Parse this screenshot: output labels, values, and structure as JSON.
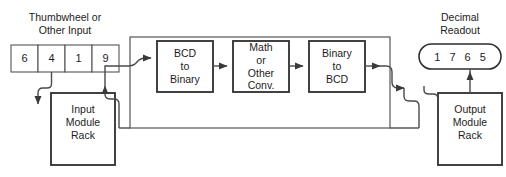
{
  "diagram": {
    "colors": {
      "background": "#ffffff",
      "box_stroke": "#2e2e2e",
      "wire": "#4a4a4a",
      "thin_stroke": "#555555",
      "text": "#1c1c1c"
    }
  },
  "input_section": {
    "caption": "Thumbwheel or\nOther Input",
    "digits": [
      "6",
      "4",
      "1",
      "9"
    ],
    "rack_label": "Input\nModule\nRack"
  },
  "processor": {
    "blocks": [
      {
        "label": "BCD\nto\nBinary"
      },
      {
        "label": "Math\nor\nOther\nConv."
      },
      {
        "label": "Binary\nto\nBCD"
      }
    ]
  },
  "output_section": {
    "caption": "Decimal\nReadout",
    "digits": [
      "1",
      "7",
      "6",
      "5"
    ],
    "rack_label": "Output\nModule\nRack"
  }
}
